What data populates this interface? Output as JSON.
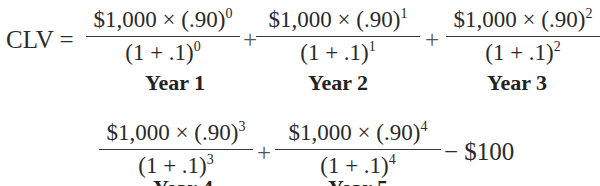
{
  "equation": {
    "lhs": "CLV =",
    "row1": {
      "terms": [
        {
          "numerator": "$1,000 × (.90)",
          "num_exp": "0",
          "denominator": "(1 + .1)",
          "den_exp": "0",
          "label": "Year 1"
        },
        {
          "numerator": "$1,000 × (.90)",
          "num_exp": "1",
          "denominator": "(1 + .1)",
          "den_exp": "1",
          "label": "Year 2"
        },
        {
          "numerator": "$1,000 × (.90)",
          "num_exp": "2",
          "denominator": "(1 + .1)",
          "den_exp": "2",
          "label": "Year 3"
        }
      ],
      "operators": [
        "+",
        "+"
      ]
    },
    "row2": {
      "terms": [
        {
          "numerator": "$1,000 × (.90)",
          "num_exp": "3",
          "denominator": "(1 + .1)",
          "den_exp": "3",
          "label": "Year 4"
        },
        {
          "numerator": "$1,000 × (.90)",
          "num_exp": "4",
          "denominator": "(1 + .1)",
          "den_exp": "4",
          "label": "Year 5"
        }
      ],
      "operators": [
        "+"
      ],
      "tail": "− $100"
    }
  }
}
